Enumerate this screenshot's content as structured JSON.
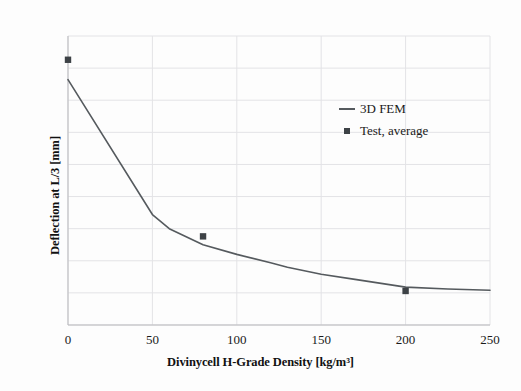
{
  "chart_data": {
    "type": "line",
    "title": "",
    "xlabel": "Divinycell H-Grade Density [kg/m³]",
    "ylabel": "Deflection at L/3 [mm]",
    "xlim": [
      0,
      250
    ],
    "ylim": [
      0,
      4.5
    ],
    "xticks": [
      "0",
      "50",
      "100",
      "150",
      "200",
      "250"
    ],
    "xtick_values": [
      0,
      50,
      100,
      150,
      200,
      250
    ],
    "yticks": [
      "0",
      "0,5",
      "1",
      "1,5",
      "2",
      "2,5",
      "3",
      "3,5",
      "4",
      "4,5"
    ],
    "ytick_values": [
      0,
      0.5,
      1,
      1.5,
      2,
      2.5,
      3,
      3.5,
      4,
      4.5
    ],
    "grid": true,
    "legend_position": "upper right",
    "series": [
      {
        "name": "3D FEM",
        "type": "line",
        "color": "#555a5e",
        "x": [
          0,
          50,
          60,
          80,
          100,
          120,
          130,
          150,
          170,
          200,
          225,
          250
        ],
        "values": [
          3.82,
          1.72,
          1.5,
          1.25,
          1.1,
          0.97,
          0.9,
          0.79,
          0.71,
          0.59,
          0.56,
          0.54
        ]
      },
      {
        "name": "Test, average",
        "type": "scatter",
        "color": "#3d4246",
        "x": [
          0,
          80,
          200
        ],
        "values": [
          4.13,
          1.38,
          0.53
        ]
      }
    ]
  },
  "legend": {
    "items": [
      {
        "label": "3D FEM",
        "key": "line-key"
      },
      {
        "label": "Test, average",
        "key": "square-marker-key"
      }
    ]
  },
  "colors": {
    "line": "#555a5e",
    "marker": "#3d4246",
    "grid": "#e3e3e6",
    "axis": "#b9b9bd",
    "text": "#1a1a1a",
    "background": "#fdfdfd"
  }
}
